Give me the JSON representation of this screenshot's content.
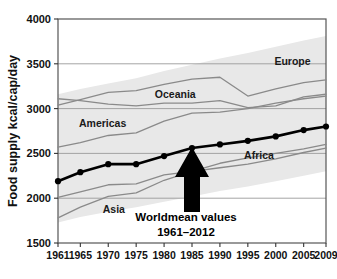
{
  "chart_data": {
    "type": "line",
    "title": "",
    "xlabel": "",
    "ylabel": "Food supply kcal/cap/day",
    "xlim": [
      1961,
      2009
    ],
    "ylim": [
      1500,
      4000
    ],
    "grid": true,
    "legend_position": "inline-annotations",
    "x": [
      1961,
      1965,
      1970,
      1975,
      1980,
      1985,
      1990,
      1995,
      2000,
      2005,
      2009
    ],
    "xtick_labels": [
      "1961",
      "1965",
      "1970",
      "1975",
      "1980",
      "1985",
      "1990",
      "1995",
      "2000",
      "2005",
      "2009"
    ],
    "ytick_labels": [
      "1500",
      "2000",
      "2500",
      "3000",
      "3500",
      "4000"
    ],
    "ytick_values": [
      1500,
      2000,
      2500,
      3000,
      3500,
      4000
    ],
    "series": [
      {
        "name": "Worldmean",
        "style": "thick-black-with-markers",
        "values": [
          2190,
          2290,
          2380,
          2380,
          2470,
          2560,
          2600,
          2640,
          2690,
          2760,
          2800
        ]
      },
      {
        "name": "Europe",
        "style": "thin-gray",
        "values": [
          3040,
          3100,
          3180,
          3200,
          3270,
          3330,
          3350,
          3140,
          3220,
          3290,
          3320
        ]
      },
      {
        "name": "Oceania",
        "style": "thin-gray",
        "values": [
          3110,
          3090,
          3050,
          3030,
          3060,
          3060,
          3090,
          3010,
          3030,
          3130,
          3160
        ]
      },
      {
        "name": "Americas",
        "style": "thin-gray",
        "values": [
          2570,
          2620,
          2700,
          2730,
          2860,
          2950,
          2960,
          3000,
          3060,
          3110,
          3140
        ]
      },
      {
        "name": "Africa",
        "style": "thin-gray",
        "values": [
          2010,
          2070,
          2150,
          2160,
          2260,
          2300,
          2340,
          2380,
          2440,
          2510,
          2560
        ]
      },
      {
        "name": "Asia",
        "style": "thin-gray",
        "values": [
          1780,
          1900,
          2020,
          2060,
          2200,
          2300,
          2390,
          2450,
          2500,
          2550,
          2600
        ]
      }
    ],
    "band": {
      "name": "range-envelope",
      "color": "#e8e8e8",
      "upper": [
        3160,
        3220,
        3280,
        3340,
        3420,
        3490,
        3560,
        3620,
        3690,
        3760,
        3810
      ],
      "lower": [
        1730,
        1790,
        1850,
        1900,
        1960,
        2020,
        2080,
        2130,
        2190,
        2250,
        2300
      ]
    },
    "region_labels": [
      {
        "name": "Europe",
        "text": "Europe",
        "x": 2003,
        "y": 3490
      },
      {
        "name": "Oceania",
        "text": "Oceania",
        "x": 1982,
        "y": 3120
      },
      {
        "name": "Americas",
        "text": "Americas",
        "x": 1969,
        "y": 2790
      },
      {
        "name": "Africa",
        "text": "Africa",
        "x": 1997,
        "y": 2440
      },
      {
        "name": "Asia",
        "text": "Asia",
        "x": 1971,
        "y": 1830
      }
    ],
    "annotation": {
      "line1": "Worldmean values",
      "line2": "1961–2012",
      "arrow_target_x": 1985,
      "arrow_target_y": 2560
    },
    "colors": {
      "worldmean_line": "#000000",
      "region_line": "#8a8a8a",
      "band_fill": "#e9e9e9",
      "grid": "#9a9a9a",
      "axis": "#555555",
      "background": "#ffffff",
      "text": "#111111"
    }
  }
}
